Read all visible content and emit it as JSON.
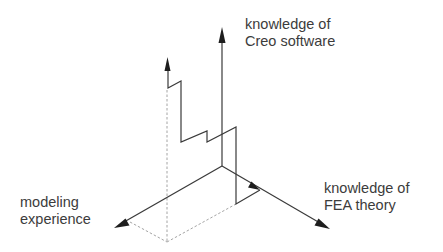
{
  "diagram": {
    "type": "three-axis competency diagram",
    "axes": {
      "vertical": {
        "label_line1": "knowledge of",
        "label_line2": "Creo software"
      },
      "right": {
        "label_line1": "knowledge of",
        "label_line2": "FEA theory"
      },
      "left": {
        "label_line1": "modeling",
        "label_line2": "experience"
      }
    },
    "colors": {
      "line": "#3a3a3a",
      "arrowhead": "#1e1e1e",
      "dashed": "#9a9a9a",
      "text": "#3c3c3c",
      "background": "#ffffff"
    }
  }
}
